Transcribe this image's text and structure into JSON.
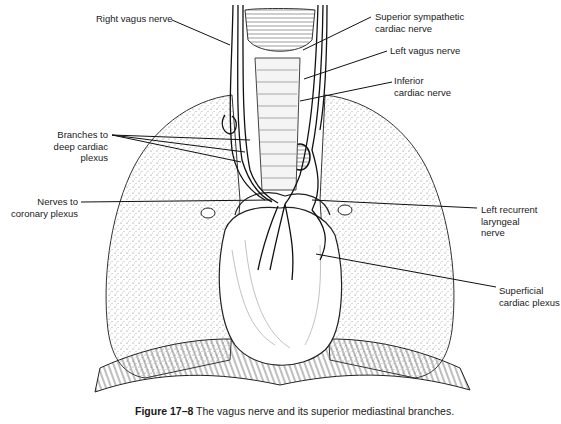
{
  "figure": {
    "caption_number": "Figure 17–8",
    "caption_text": "The vagus nerve and its superior mediastinal branches."
  },
  "labels": {
    "right_vagus": "Right vagus nerve",
    "superior_sympathetic_1": "Superior sympathetic",
    "superior_sympathetic_2": "cardiac nerve",
    "left_vagus": "Left vagus nerve",
    "inferior_cardiac_1": "Inferior",
    "inferior_cardiac_2": "cardiac nerve",
    "branches_1": "Branches to",
    "branches_2": "deep cardiac",
    "branches_3": "plexus",
    "coronary_1": "Nerves to",
    "coronary_2": "coronary plexus",
    "recurrent_1": "Left recurrent",
    "recurrent_2": "laryngeal",
    "recurrent_3": "nerve",
    "superficial_1": "Superficial",
    "superficial_2": "cardiac plexus"
  },
  "colors": {
    "ink": "#1a1a1a",
    "lung_stipple": "#8a8a8a",
    "background": "#ffffff"
  }
}
